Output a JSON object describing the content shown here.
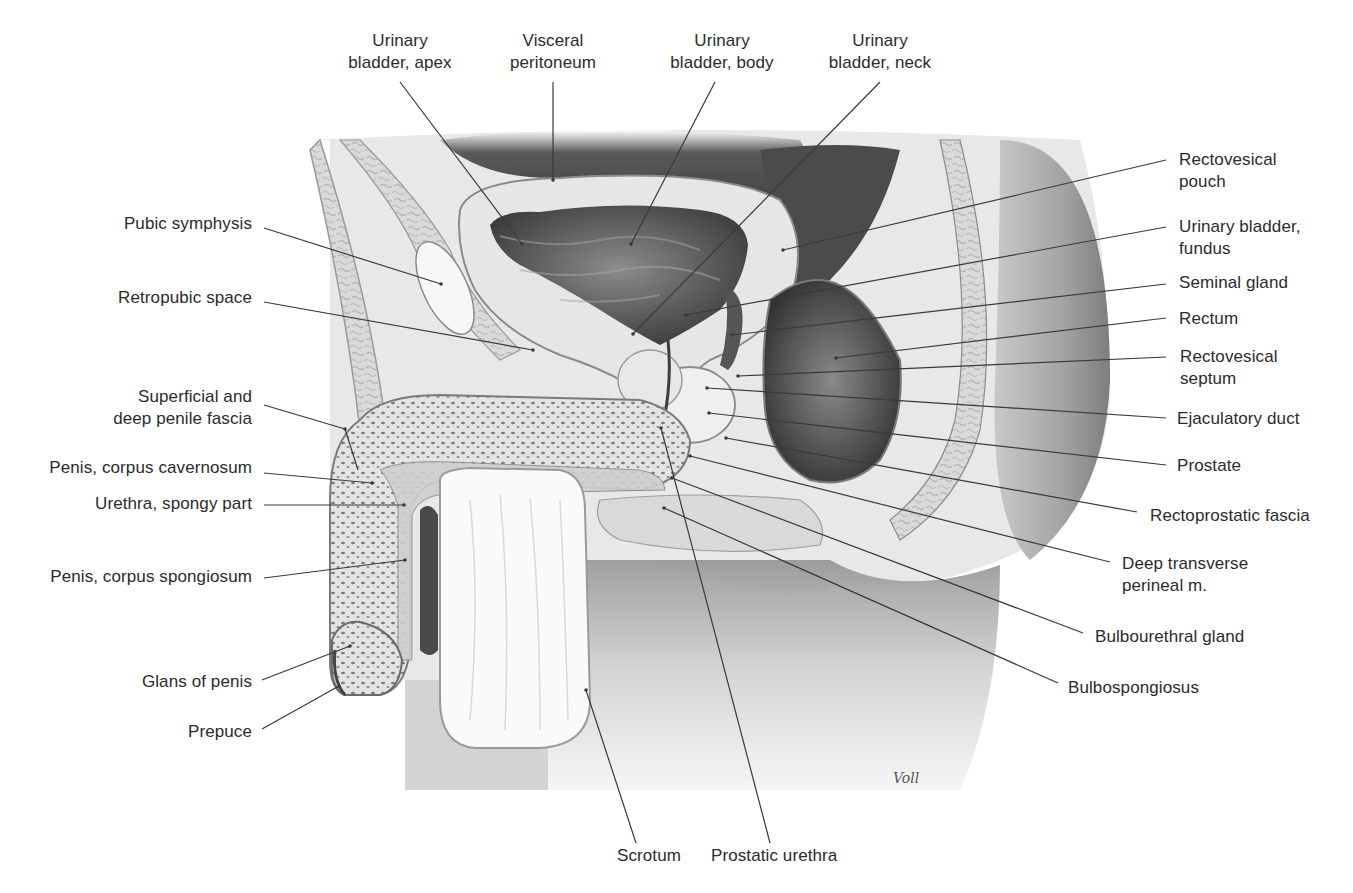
{
  "figure": {
    "top_caption_fragment": "",
    "signature": "Voll",
    "colors": {
      "background": "#ffffff",
      "text": "#2b2b2b",
      "leader_line": "#3a3a3a",
      "tissue_light": "#eeeeee",
      "tissue_mid": "#bdbdbd",
      "tissue_dark": "#4a4a4a",
      "cavity_dark": "#3c3c3c"
    }
  },
  "labels_top": [
    {
      "id": "urinary-bladder-apex",
      "line1": "Urinary",
      "line2": "bladder, apex",
      "x": 340,
      "y": 30,
      "w": 120,
      "lx1": 400,
      "ly1": 82,
      "lx2": 522,
      "ly2": 244
    },
    {
      "id": "visceral-peritoneum",
      "line1": "Visceral",
      "line2": "peritoneum",
      "x": 493,
      "y": 30,
      "w": 120,
      "lx1": 553,
      "ly1": 82,
      "lx2": 553,
      "ly2": 180
    },
    {
      "id": "urinary-bladder-body",
      "line1": "Urinary",
      "line2": "bladder, body",
      "x": 662,
      "y": 30,
      "w": 120,
      "lx1": 715,
      "ly1": 82,
      "lx2": 631,
      "ly2": 244
    },
    {
      "id": "urinary-bladder-neck",
      "line1": "Urinary",
      "line2": "bladder, neck",
      "x": 820,
      "y": 30,
      "w": 130,
      "lx1": 880,
      "ly1": 82,
      "lx2": 633,
      "ly2": 334
    }
  ],
  "labels_left": [
    {
      "id": "pubic-symphysis",
      "line1": "Pubic symphysis",
      "line2": "",
      "x": 20,
      "y": 213,
      "w": 232,
      "lx1": 264,
      "ly1": 228,
      "lx2": 441,
      "ly2": 284
    },
    {
      "id": "retropubic-space",
      "line1": "Retropubic space",
      "line2": "",
      "x": 20,
      "y": 287,
      "w": 232,
      "lx1": 264,
      "ly1": 302,
      "lx2": 533,
      "ly2": 350
    },
    {
      "id": "superficial-deep-penile-fascia",
      "line1": "Superficial and",
      "line2": "deep penile fascia",
      "x": 20,
      "y": 388,
      "w": 232,
      "lx1": 264,
      "ly1": 405,
      "lx2": 345,
      "ly2": 429
    },
    {
      "id": "penis-corpus-cavernosum",
      "line1": "Penis, corpus cavernosum",
      "line2": "",
      "x": 0,
      "y": 458,
      "w": 252,
      "lx1": 264,
      "ly1": 473,
      "lx2": 372,
      "ly2": 483
    },
    {
      "id": "urethra-spongy-part",
      "line1": "Urethra, spongy part",
      "line2": "",
      "x": 0,
      "y": 494,
      "w": 252,
      "lx1": 264,
      "ly1": 505,
      "lx2": 404,
      "ly2": 505
    },
    {
      "id": "penis-corpus-spongiosum",
      "line1": "Penis, corpus spongiosum",
      "line2": "",
      "x": 0,
      "y": 567,
      "w": 252,
      "lx1": 264,
      "ly1": 578,
      "lx2": 405,
      "ly2": 560
    },
    {
      "id": "glans-of-penis",
      "line1": "Glans of penis",
      "line2": "",
      "x": 0,
      "y": 672,
      "w": 252,
      "lx1": 262,
      "ly1": 680,
      "lx2": 350,
      "ly2": 646
    },
    {
      "id": "prepuce",
      "line1": "Prepuce",
      "line2": "",
      "x": 0,
      "y": 722,
      "w": 252,
      "lx1": 262,
      "ly1": 729,
      "lx2": 339,
      "ly2": 686
    }
  ],
  "labels_right": [
    {
      "id": "rectovesical-pouch",
      "line1": "Rectovesical",
      "line2": "pouch",
      "x": 1179,
      "y": 149,
      "w": 170,
      "lx1": 1166,
      "ly1": 160,
      "lx2": 783,
      "ly2": 250
    },
    {
      "id": "urinary-bladder-fundus",
      "line1": "Urinary bladder,",
      "line2": "fundus",
      "x": 1179,
      "y": 216,
      "w": 170,
      "lx1": 1166,
      "ly1": 227,
      "lx2": 686,
      "ly2": 315
    },
    {
      "id": "seminal-gland",
      "line1": "Seminal gland",
      "line2": "",
      "x": 1179,
      "y": 272,
      "w": 170,
      "lx1": 1166,
      "ly1": 284,
      "lx2": 732,
      "ly2": 335
    },
    {
      "id": "rectum",
      "line1": "Rectum",
      "line2": "",
      "x": 1179,
      "y": 308,
      "w": 170,
      "lx1": 1166,
      "ly1": 318,
      "lx2": 836,
      "ly2": 358
    },
    {
      "id": "rectovesical-septum",
      "line1": "Rectovesical",
      "line2": "septum",
      "x": 1180,
      "y": 346,
      "w": 170,
      "lx1": 1166,
      "ly1": 357,
      "lx2": 738,
      "ly2": 376
    },
    {
      "id": "ejaculatory-duct",
      "line1": "Ejaculatory duct",
      "line2": "",
      "x": 1177,
      "y": 408,
      "w": 170,
      "lx1": 1166,
      "ly1": 418,
      "lx2": 707,
      "ly2": 388
    },
    {
      "id": "prostate",
      "line1": "Prostate",
      "line2": "",
      "x": 1177,
      "y": 455,
      "w": 170,
      "lx1": 1166,
      "ly1": 465,
      "lx2": 709,
      "ly2": 413
    },
    {
      "id": "rectoprostatic-fascia",
      "line1": "Rectoprostatic fascia",
      "line2": "",
      "x": 1150,
      "y": 505,
      "w": 200,
      "lx1": 1137,
      "ly1": 512,
      "lx2": 726,
      "ly2": 438
    },
    {
      "id": "deep-transverse-perineal-m",
      "line1": "Deep transverse",
      "line2": "perineal m.",
      "x": 1122,
      "y": 553,
      "w": 170,
      "lx1": 1110,
      "ly1": 562,
      "lx2": 690,
      "ly2": 456
    },
    {
      "id": "bulbourethral-gland",
      "line1": "Bulbourethral gland",
      "line2": "",
      "x": 1095,
      "y": 626,
      "w": 200,
      "lx1": 1083,
      "ly1": 633,
      "lx2": 672,
      "ly2": 478
    },
    {
      "id": "bulbospongiosus",
      "line1": "Bulbospongiosus",
      "line2": "",
      "x": 1068,
      "y": 677,
      "w": 200,
      "lx1": 1058,
      "ly1": 683,
      "lx2": 664,
      "ly2": 508
    }
  ],
  "labels_bottom": [
    {
      "id": "scrotum",
      "line1": "Scrotum",
      "line2": "",
      "x": 604,
      "y": 845,
      "w": 90,
      "lx1": 636,
      "ly1": 843,
      "lx2": 586,
      "ly2": 690
    },
    {
      "id": "prostatic-urethra",
      "line1": "Prostatic urethra",
      "line2": "",
      "x": 708,
      "y": 845,
      "w": 170,
      "lx1": 770,
      "ly1": 843,
      "lx2": 661,
      "ly2": 428
    }
  ]
}
